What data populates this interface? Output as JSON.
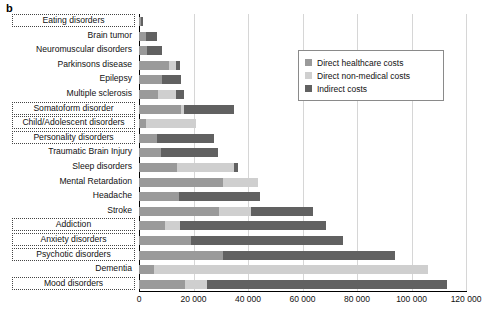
{
  "panel": {
    "letter": "b"
  },
  "legend": {
    "position": "top-right",
    "entries": [
      {
        "label": "Direct healthcare costs",
        "color": "#9a9a9a",
        "key": "direct_healthcare"
      },
      {
        "label": "Direct non-medical costs",
        "color": "#cfcfcf",
        "key": "direct_non_medical"
      },
      {
        "label": "Indirect costs",
        "color": "#616161",
        "key": "indirect"
      }
    ]
  },
  "chart_data": {
    "type": "bar",
    "orientation": "horizontal",
    "stacked": true,
    "title": "",
    "xlabel": "",
    "ylabel": "",
    "xlim": [
      0,
      120000
    ],
    "xticks": [
      0,
      20000,
      40000,
      60000,
      80000,
      100000,
      120000
    ],
    "xtick_labels": [
      "0",
      "20 000",
      "40 000",
      "60 000",
      "80 000",
      "100 000",
      "120 000"
    ],
    "grid": "vertical",
    "categories": [
      "Eating disorders",
      "Brain tumor",
      "Neuromuscular disorders",
      "Parkinsons disease",
      "Epilepsy",
      "Multiple sclerosis",
      "Somatoform disorder",
      "Child/Adolescent disorders",
      "Personality disorders",
      "Traumatic Brain Injury",
      "Sleep disorders",
      "Mental Retardation",
      "Headache",
      "Stroke",
      "Addiction",
      "Anxiety disorders",
      "Psychotic disorders",
      "Dementia",
      "Mood disorders"
    ],
    "highlighted_categories": [
      "Eating disorders",
      "Somatoform disorder",
      "Child/Adolescent disorders",
      "Personality disorders",
      "Addiction",
      "Anxiety disorders",
      "Psychotic disorders",
      "Mood disorders"
    ],
    "series": [
      {
        "name": "Direct healthcare costs",
        "color": "#9a9a9a",
        "values": [
          800,
          2600,
          3000,
          11000,
          8500,
          7000,
          15500,
          2500,
          6500,
          8000,
          14000,
          31000,
          14500,
          29500,
          9500,
          19000,
          31000,
          5500,
          17000
        ]
      },
      {
        "name": "Direct non-medical costs",
        "color": "#cfcfcf",
        "values": [
          0,
          0,
          0,
          2500,
          0,
          6500,
          1000,
          18500,
          0,
          0,
          21000,
          12500,
          0,
          11500,
          5500,
          0,
          0,
          100500,
          8000
        ]
      },
      {
        "name": "Indirect costs",
        "color": "#616161",
        "values": [
          700,
          4000,
          5500,
          1500,
          7000,
          3000,
          18500,
          0,
          21000,
          21000,
          1500,
          0,
          30000,
          23000,
          53500,
          56000,
          63000,
          0,
          88000
        ]
      }
    ],
    "totals": [
      1500,
      6600,
      8500,
      15000,
      15500,
      16500,
      35000,
      21000,
      27500,
      29000,
      36500,
      43500,
      44500,
      64000,
      68500,
      75000,
      94000,
      106000,
      113000
    ]
  }
}
